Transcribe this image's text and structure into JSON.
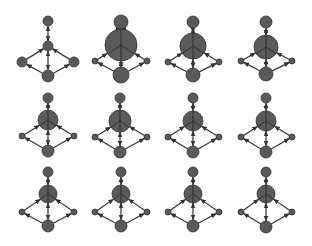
{
  "colors": {
    "background": "#ffffff",
    "node_fill": "#5a5a5a",
    "node_stroke": "#2e2e2e",
    "edge": "#333333"
  },
  "grid": {
    "rows": 3,
    "cols": 4
  },
  "graphs": [
    {
      "row": 0,
      "col": 0,
      "nodes": {
        "top": [
          48,
          21,
          5
        ],
        "center": [
          48,
          46,
          5
        ],
        "left": [
          22,
          62,
          5
        ],
        "right": [
          74,
          62,
          5
        ],
        "bottom": [
          48,
          76,
          6
        ]
      }
    },
    {
      "row": 0,
      "col": 1,
      "nodes": {
        "top": [
          121,
          22,
          7
        ],
        "center": [
          121,
          45,
          16
        ],
        "left": [
          95,
          61,
          3
        ],
        "right": [
          147,
          61,
          3
        ],
        "bottom": [
          121,
          75,
          8
        ]
      }
    },
    {
      "row": 0,
      "col": 2,
      "nodes": {
        "top": [
          193,
          22,
          6
        ],
        "center": [
          193,
          46,
          13
        ],
        "left": [
          168,
          62,
          3
        ],
        "right": [
          219,
          62,
          3
        ],
        "bottom": [
          193,
          75,
          7
        ]
      }
    },
    {
      "row": 0,
      "col": 3,
      "nodes": {
        "top": [
          266,
          22,
          6
        ],
        "center": [
          266,
          47,
          12
        ],
        "left": [
          241,
          61,
          3
        ],
        "right": [
          292,
          61,
          3
        ],
        "bottom": [
          266,
          74,
          7
        ]
      }
    },
    {
      "row": 1,
      "col": 0,
      "nodes": {
        "top": [
          48,
          98,
          5
        ],
        "center": [
          48,
          120,
          10
        ],
        "left": [
          22,
          136,
          3
        ],
        "right": [
          74,
          136,
          3
        ],
        "bottom": [
          48,
          151,
          6
        ]
      }
    },
    {
      "row": 1,
      "col": 1,
      "nodes": {
        "top": [
          120,
          98,
          5
        ],
        "center": [
          120,
          121,
          11
        ],
        "left": [
          95,
          137,
          3
        ],
        "right": [
          147,
          137,
          3
        ],
        "bottom": [
          120,
          152,
          6
        ]
      }
    },
    {
      "row": 1,
      "col": 2,
      "nodes": {
        "top": [
          193,
          98,
          5
        ],
        "center": [
          193,
          121,
          10
        ],
        "left": [
          168,
          137,
          3
        ],
        "right": [
          219,
          137,
          3
        ],
        "bottom": [
          193,
          152,
          6
        ]
      }
    },
    {
      "row": 1,
      "col": 3,
      "nodes": {
        "top": [
          266,
          98,
          5
        ],
        "center": [
          266,
          121,
          10
        ],
        "left": [
          241,
          137,
          3
        ],
        "right": [
          292,
          137,
          3
        ],
        "bottom": [
          266,
          152,
          6
        ]
      }
    },
    {
      "row": 2,
      "col": 0,
      "nodes": {
        "top": [
          48,
          172,
          5
        ],
        "center": [
          48,
          194,
          9
        ],
        "left": [
          22,
          212,
          3
        ],
        "right": [
          74,
          212,
          3
        ],
        "bottom": [
          48,
          226,
          6
        ]
      }
    },
    {
      "row": 2,
      "col": 1,
      "nodes": {
        "top": [
          121,
          172,
          5
        ],
        "center": [
          121,
          194,
          9
        ],
        "left": [
          95,
          212,
          3
        ],
        "right": [
          147,
          212,
          3
        ],
        "bottom": [
          121,
          226,
          6
        ]
      }
    },
    {
      "row": 2,
      "col": 2,
      "nodes": {
        "top": [
          193,
          172,
          5
        ],
        "center": [
          193,
          194,
          9
        ],
        "left": [
          168,
          212,
          3
        ],
        "right": [
          219,
          212,
          3
        ],
        "bottom": [
          193,
          226,
          6
        ]
      }
    },
    {
      "row": 2,
      "col": 3,
      "nodes": {
        "top": [
          266,
          172,
          5
        ],
        "center": [
          266,
          194,
          9
        ],
        "left": [
          241,
          212,
          3
        ],
        "right": [
          292,
          212,
          3
        ],
        "bottom": [
          266,
          227,
          6
        ]
      }
    }
  ],
  "edges": [
    {
      "from": "top",
      "to": "center",
      "bidirectional": true
    },
    {
      "from": "center",
      "to": "bottom",
      "bidirectional": true
    },
    {
      "from": "left",
      "to": "center",
      "bidirectional": false
    },
    {
      "from": "right",
      "to": "center",
      "bidirectional": false
    },
    {
      "from": "bottom",
      "to": "left",
      "bidirectional": false
    },
    {
      "from": "bottom",
      "to": "right",
      "bidirectional": false
    }
  ]
}
